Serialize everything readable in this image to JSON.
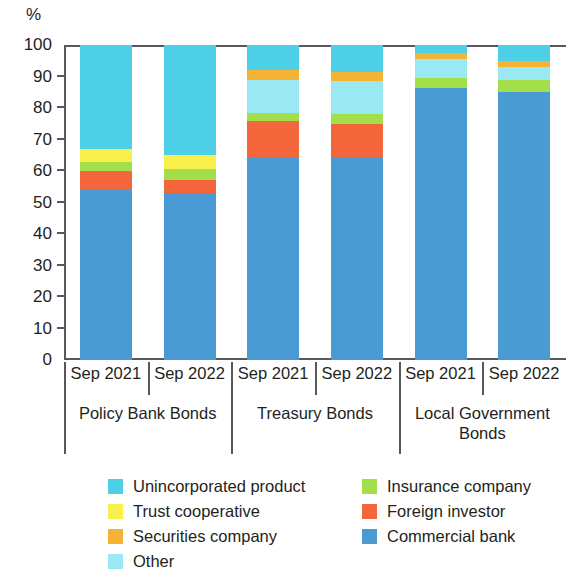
{
  "chart_data": {
    "type": "bar",
    "subtype": "stacked-bar-100-percent",
    "title": "",
    "xlabel": "",
    "ylabel": "%",
    "ylim": [
      0,
      100
    ],
    "ytick_labels": [
      "100",
      "90",
      "80",
      "70",
      "60",
      "50",
      "40",
      "30",
      "20",
      "10",
      "0"
    ],
    "ytick_values": [
      100,
      90,
      80,
      70,
      60,
      50,
      40,
      30,
      20,
      10,
      0
    ],
    "grid": false,
    "legend_position": "bottom",
    "groups": [
      {
        "label": "Policy Bank Bonds",
        "categories": [
          "Sep 2021",
          "Sep 2022"
        ]
      },
      {
        "label": "Treasury Bonds",
        "categories": [
          "Sep 2021",
          "Sep 2022"
        ]
      },
      {
        "label": "Local Government Bonds",
        "categories": [
          "Sep 2021",
          "Sep 2022"
        ]
      }
    ],
    "categories": [
      "Sep 2021",
      "Sep 2022",
      "Sep 2021",
      "Sep 2022",
      "Sep 2021",
      "Sep 2022"
    ],
    "series": [
      {
        "name": "Commercial bank",
        "color": "#4a9ad4",
        "values": [
          54,
          53,
          64.5,
          64.5,
          86.5,
          85
        ]
      },
      {
        "name": "Foreign investor",
        "color": "#f4663c",
        "values": [
          6,
          4,
          11.5,
          10.5,
          0,
          0
        ]
      },
      {
        "name": "Insurance company",
        "color": "#a3df4a",
        "values": [
          3,
          3.5,
          2.5,
          3,
          3,
          4
        ]
      },
      {
        "name": "Other",
        "color": "#9ae8f2",
        "values": [
          0,
          0,
          10.5,
          10.5,
          6,
          4
        ]
      },
      {
        "name": "Securities company",
        "color": "#f5b335",
        "values": [
          0,
          0,
          3,
          3,
          2,
          2
        ]
      },
      {
        "name": "Trust cooperative",
        "color": "#faf04b",
        "values": [
          4,
          4.5,
          0,
          0,
          0,
          0
        ]
      },
      {
        "name": "Unincorporated product",
        "color": "#4ecfe8",
        "values": [
          33,
          35,
          8,
          8.5,
          2.5,
          5
        ]
      }
    ],
    "stack_order_bottom_to_top": [
      "Commercial bank",
      "Foreign investor",
      "Insurance company",
      "Other",
      "Securities company",
      "Trust cooperative",
      "Unincorporated product"
    ]
  },
  "axis": {
    "unit_label": "%"
  },
  "legend": {
    "left_column": [
      {
        "label": "Unincorporated product",
        "color": "#4ecfe8"
      },
      {
        "label": "Trust cooperative",
        "color": "#faf04b"
      },
      {
        "label": "Securities company",
        "color": "#f5b335"
      },
      {
        "label": "Other",
        "color": "#9ae8f2"
      }
    ],
    "right_column": [
      {
        "label": "Insurance company",
        "color": "#a3df4a"
      },
      {
        "label": "Foreign investor",
        "color": "#f4663c"
      },
      {
        "label": "Commercial bank",
        "color": "#4a9ad4"
      }
    ]
  }
}
